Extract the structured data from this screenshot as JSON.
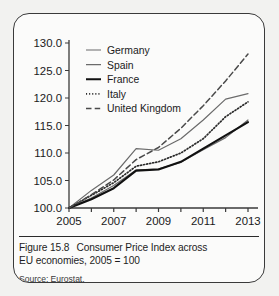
{
  "figure": {
    "caption_number": "Figure 15.8",
    "caption_text": "Consumer Price Index across",
    "caption_text_line2": "EU economies, 2005 = 100",
    "source": "Source: Eurostat."
  },
  "chart_data": {
    "type": "line",
    "title": "",
    "xlabel": "",
    "ylabel": "",
    "x": [
      2005,
      2006,
      2007,
      2008,
      2009,
      2010,
      2011,
      2012,
      2013
    ],
    "xtick_labels": [
      "2005",
      "2007",
      "2009",
      "2011",
      "2013"
    ],
    "xticks": [
      2005,
      2007,
      2009,
      2011,
      2013
    ],
    "xlim": [
      2005,
      2013
    ],
    "ytick_labels": [
      "100.0",
      "105.0",
      "110.0",
      "115.0",
      "120.0",
      "125.0",
      "130.0"
    ],
    "yticks": [
      100.0,
      105.0,
      110.0,
      115.0,
      120.0,
      125.0,
      130.0
    ],
    "ylim": [
      100.0,
      130.0
    ],
    "grid": false,
    "legend_position": "top-center",
    "series": [
      {
        "name": "Germany",
        "style": "solid-thin",
        "color": "#6b6b6b",
        "values": [
          100.0,
          101.8,
          104.1,
          106.9,
          107.1,
          108.3,
          110.6,
          112.8,
          116.0
        ]
      },
      {
        "name": "Spain",
        "style": "solid-thin",
        "color": "#6b6b6b",
        "values": [
          100.0,
          103.2,
          106.0,
          110.8,
          110.5,
          112.6,
          116.0,
          119.8,
          120.8
        ]
      },
      {
        "name": "France",
        "style": "solid-thick",
        "color": "#111111",
        "values": [
          100.0,
          101.6,
          103.6,
          106.8,
          107.0,
          108.4,
          110.8,
          113.2,
          115.6
        ]
      },
      {
        "name": "Italy",
        "style": "dotted",
        "color": "#2a2a2a",
        "values": [
          100.0,
          102.3,
          104.6,
          107.6,
          108.4,
          110.0,
          112.6,
          116.6,
          119.3
        ]
      },
      {
        "name": "United Kingdom",
        "style": "dashed",
        "color": "#4a4a4a",
        "values": [
          100.0,
          102.4,
          105.1,
          108.8,
          111.0,
          114.5,
          118.6,
          123.1,
          128.0
        ]
      }
    ]
  }
}
